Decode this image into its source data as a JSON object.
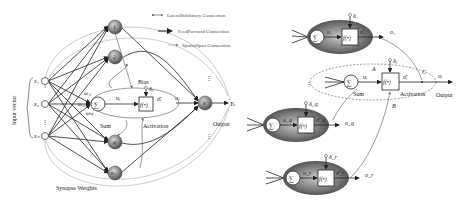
{
  "legend": {
    "items": [
      {
        "label": "LateralInhibitory Connection",
        "kind": "lateral-inhibitory"
      },
      {
        "label": "FeedForward Connection",
        "kind": "feedforward"
      },
      {
        "label": "SpatialSpan Connection",
        "kind": "spatial-span"
      }
    ]
  },
  "left_network": {
    "input_vector_label": "Input vector",
    "inputs": [
      "x₁",
      "x₂",
      "⋮",
      "xₙ"
    ],
    "hidden_nodes": [
      "1",
      "2",
      "q",
      "n₁"
    ],
    "weights": [
      "ω₁ⱼ",
      "ω₂ⱼ",
      "ωₙⱼ"
    ],
    "sum_symbol": "∑",
    "sum_label": "Sum",
    "u_label": "uⱼ",
    "activation_fn": "f(•)",
    "activation_label": "Activation",
    "bias_label": "Bias",
    "bias_symbol": "δⱼ",
    "sigma_label": "σ̄ⱼ",
    "o_label": "oⱼ",
    "output_node": "k",
    "output_label": "Output",
    "output_symbol": "Yₖ",
    "synapse_label": "Synapse Weights",
    "vdots": "⋮"
  },
  "right_network": {
    "neurons": [
      {
        "id": "1",
        "sum": "∑",
        "u": "u₁",
        "fn": "f(•)",
        "delta": "δ₁",
        "sigma": "σ̄₁",
        "out": "o₁"
      },
      {
        "id": "q",
        "sum": "∑",
        "u": "u_q",
        "fn": "f(•)",
        "delta": "δ_q",
        "sigma": "σ̄_q",
        "out": "o_q"
      },
      {
        "id": "r",
        "sum": "∑",
        "u": "u_r",
        "fn": "f(•)",
        "delta": "δ_r",
        "sigma": "σ̄_r",
        "out": "o_r"
      }
    ],
    "center": {
      "sum": "∑",
      "sum_label": "Sum",
      "u": "uⱼ",
      "fn": "f(•)",
      "delta": "δⱼ",
      "sigma": "σ̄ⱼ",
      "out": "oⱼ",
      "activation_label": "Activation",
      "output_label": "Output",
      "point_a": "A",
      "point_b": "B",
      "point_c": "C"
    },
    "vdots": "⋮"
  }
}
